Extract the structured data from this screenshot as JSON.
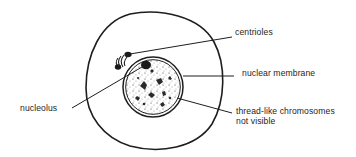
{
  "diagram": {
    "type": "labelled cell diagram",
    "colors": {
      "ink": "#1e1e1e",
      "background": "#ffffff"
    },
    "labels": {
      "centrioles": "centrioles",
      "nuclear_membrane": "nuclear membrane",
      "chromosomes_line1": "thread-like chromosomes",
      "chromosomes_line2": "not visible",
      "nucleolus": "nucleolus"
    },
    "parts": [
      {
        "id": "cell-membrane",
        "shape": "ellipse",
        "cx": 154,
        "cy": 80,
        "rx": 68,
        "ry": 69
      },
      {
        "id": "nucleus",
        "shape": "double-circle",
        "cx": 153,
        "cy": 87,
        "r": 30
      },
      {
        "id": "nucleolus",
        "shape": "dark-blob",
        "cx": 146,
        "cy": 64
      },
      {
        "id": "centrioles",
        "shape": "pair-with-arcs",
        "cx": 122,
        "cy": 60
      }
    ]
  }
}
